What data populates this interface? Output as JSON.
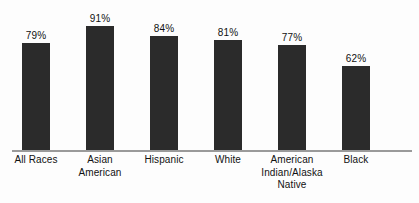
{
  "chart_data": {
    "type": "bar",
    "title": "",
    "subtitle": "",
    "xlabel": "",
    "ylabel": "",
    "ylim": [
      0,
      100
    ],
    "grid": false,
    "legend": false,
    "value_suffix": "%",
    "bar_color": "#2b2b2b",
    "axis_color": "#9a9a9a",
    "background_color": "#fdfdfd",
    "categories": [
      "All Races",
      "Asian American",
      "Hispanic",
      "White",
      "American Indian/Alaska Native",
      "Black"
    ],
    "values": [
      79,
      91,
      84,
      81,
      77,
      62
    ],
    "data_labels": [
      "79%",
      "91%",
      "84%",
      "81%",
      "77%",
      "62%"
    ],
    "category_lines": [
      [
        "All Races"
      ],
      [
        "Asian",
        "American"
      ],
      [
        "Hispanic"
      ],
      [
        "White"
      ],
      [
        "American",
        "Indian/Alaska",
        "Native"
      ],
      [
        "Black"
      ]
    ],
    "bars": [
      {
        "label": "All Races",
        "display_value": "79%",
        "value": 79,
        "left": 4
      },
      {
        "label": "Asian American",
        "display_value": "91%",
        "value": 91,
        "left": 68
      },
      {
        "label": "Hispanic",
        "display_value": "84%",
        "value": 84,
        "left": 132
      },
      {
        "label": "White",
        "display_value": "81%",
        "value": 81,
        "left": 196
      },
      {
        "label": "American Indian/Alaska Native",
        "display_value": "77%",
        "value": 77,
        "left": 260
      },
      {
        "label": "Black",
        "display_value": "62%",
        "value": 62,
        "left": 324
      }
    ]
  }
}
